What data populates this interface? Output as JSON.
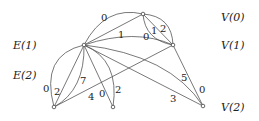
{
  "diagram": {
    "row_labels_left": [
      {
        "text": "E(1)",
        "x": 13,
        "y": 49
      },
      {
        "text": "E(2)",
        "x": 13,
        "y": 79
      }
    ],
    "row_labels_right": [
      {
        "text": "V(0)",
        "x": 221,
        "y": 21
      },
      {
        "text": "V(1)",
        "x": 221,
        "y": 49
      },
      {
        "text": "V(2)",
        "x": 221,
        "y": 111
      }
    ],
    "nodes": {
      "hub": {
        "x": 84,
        "y": 45
      },
      "v0": {
        "x": 143,
        "y": 14
      },
      "v1": {
        "x": 173,
        "y": 45
      },
      "v2": {
        "x": 203,
        "y": 106
      },
      "bl": {
        "x": 54,
        "y": 107
      },
      "bm": {
        "x": 113,
        "y": 107
      }
    },
    "edge_labels": [
      {
        "text": "0",
        "x": 101,
        "y": 21
      },
      {
        "text": "1",
        "x": 118,
        "y": 38
      },
      {
        "text": "0",
        "x": 143,
        "y": 40
      },
      {
        "text": "1",
        "x": 151,
        "y": 34
      },
      {
        "text": "2",
        "x": 160,
        "y": 32
      },
      {
        "text": "0",
        "x": 43,
        "y": 92
      },
      {
        "text": "2",
        "x": 54,
        "y": 95
      },
      {
        "text": "7",
        "x": 80,
        "y": 84
      },
      {
        "text": "4",
        "x": 88,
        "y": 100
      },
      {
        "text": "0",
        "x": 99,
        "y": 97
      },
      {
        "text": "2",
        "x": 115,
        "y": 93
      },
      {
        "text": "5",
        "x": 181,
        "y": 81
      },
      {
        "text": "0",
        "x": 199,
        "y": 93
      },
      {
        "text": "3",
        "x": 170,
        "y": 102
      }
    ]
  }
}
